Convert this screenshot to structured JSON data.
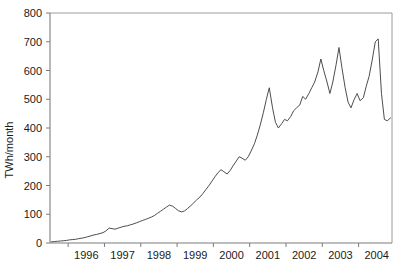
{
  "chart_data": {
    "type": "line",
    "title": "",
    "subtitle": "",
    "xlabel": "",
    "ylabel": "TWh/month",
    "xlim": [
      1995.5,
      2004.92
    ],
    "ylim": [
      0,
      800
    ],
    "grid": false,
    "legend": null,
    "series_color": "#4d4d4d",
    "axis_color": "#808080",
    "yticks": [
      0,
      100,
      200,
      300,
      400,
      500,
      600,
      700,
      800
    ],
    "ytick_labels": [
      "0",
      "100",
      "200",
      "300",
      "400",
      "500",
      "600",
      "700",
      "800"
    ],
    "xticks": [
      1996,
      1997,
      1998,
      1999,
      2000,
      2001,
      2002,
      2003,
      2004,
      2005
    ],
    "xtick_labels": [
      "1996",
      "1997",
      "1998",
      "1999",
      "2000",
      "2001",
      "2002",
      "2003",
      "2004"
    ],
    "xtick_label_positions": [
      1996.5,
      1997.5,
      1998.5,
      1999.5,
      2000.5,
      2001.5,
      2002.5,
      2003.5,
      2004.5
    ],
    "series": [
      {
        "name": "TWh/month",
        "x": [
          1995.54,
          1995.63,
          1995.71,
          1995.79,
          1995.88,
          1995.96,
          1996.04,
          1996.13,
          1996.21,
          1996.29,
          1996.38,
          1996.46,
          1996.54,
          1996.63,
          1996.71,
          1996.79,
          1996.88,
          1996.96,
          1997.04,
          1997.13,
          1997.21,
          1997.29,
          1997.38,
          1997.46,
          1997.54,
          1997.63,
          1997.71,
          1997.79,
          1997.88,
          1997.96,
          1998.04,
          1998.13,
          1998.21,
          1998.29,
          1998.38,
          1998.46,
          1998.54,
          1998.63,
          1998.71,
          1998.79,
          1998.88,
          1998.96,
          1999.04,
          1999.13,
          1999.21,
          1999.29,
          1999.38,
          1999.46,
          1999.54,
          1999.63,
          1999.71,
          1999.79,
          1999.88,
          1999.96,
          2000.04,
          2000.13,
          2000.21,
          2000.29,
          2000.38,
          2000.46,
          2000.54,
          2000.63,
          2000.71,
          2000.79,
          2000.88,
          2000.96,
          2001.04,
          2001.13,
          2001.21,
          2001.29,
          2001.38,
          2001.46,
          2001.54,
          2001.63,
          2001.71,
          2001.79,
          2001.88,
          2001.96,
          2002.04,
          2002.13,
          2002.21,
          2002.29,
          2002.38,
          2002.46,
          2002.54,
          2002.63,
          2002.71,
          2002.79,
          2002.88,
          2002.96,
          2003.04,
          2003.13,
          2003.21,
          2003.29,
          2003.38,
          2003.46,
          2003.54,
          2003.63,
          2003.71,
          2003.79,
          2003.88,
          2003.96,
          2004.04,
          2004.13,
          2004.21,
          2004.29,
          2004.38,
          2004.46,
          2004.54,
          2004.63,
          2004.71,
          2004.79,
          2004.88
        ],
        "values": [
          4,
          5,
          6,
          7,
          8,
          9,
          11,
          12,
          13,
          15,
          17,
          19,
          22,
          25,
          28,
          30,
          33,
          36,
          42,
          52,
          50,
          48,
          52,
          55,
          58,
          60,
          63,
          66,
          70,
          74,
          78,
          82,
          86,
          90,
          96,
          103,
          110,
          118,
          125,
          132,
          128,
          120,
          112,
          108,
          112,
          120,
          130,
          140,
          150,
          160,
          172,
          185,
          200,
          215,
          230,
          245,
          255,
          248,
          240,
          252,
          268,
          285,
          300,
          295,
          288,
          300,
          320,
          345,
          375,
          410,
          455,
          500,
          540,
          470,
          420,
          400,
          415,
          430,
          425,
          440,
          460,
          470,
          480,
          510,
          500,
          520,
          540,
          560,
          595,
          640,
          600,
          560,
          520,
          560,
          620,
          680,
          610,
          540,
          490,
          470,
          500,
          520,
          495,
          505,
          545,
          580,
          640,
          700,
          710,
          520,
          430,
          425,
          435
        ]
      }
    ],
    "notes": {
      "peak_value": 710,
      "peak_year": 2003.54,
      "final_value": 435,
      "start_value": 4
    }
  },
  "axes": {
    "ylabel_text": "TWh/month"
  }
}
